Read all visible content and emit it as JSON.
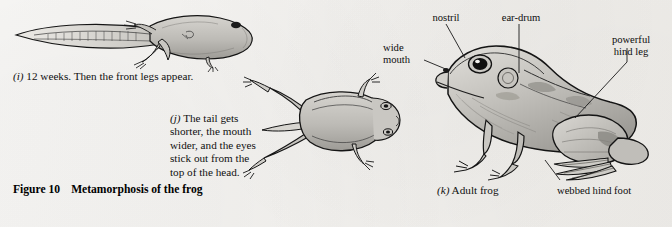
{
  "figure": {
    "number_label": "Figure 10",
    "title": "Metamorphosis of the frog"
  },
  "stages": [
    {
      "key": "i",
      "enumerator": "(i)",
      "caption": "12 weeks. Then the front legs appear.",
      "subject": "tadpole-with-legs"
    },
    {
      "key": "j",
      "enumerator": "(j)",
      "caption": "The tail gets\nshorter, the mouth\nwider, and the eyes\nstick out from the\ntop of the head.",
      "subject": "froglet"
    },
    {
      "key": "k",
      "enumerator": "(k)",
      "caption": "Adult frog",
      "subject": "adult-frog"
    }
  ],
  "anatomy_labels": [
    {
      "id": "nostril",
      "text": "nostril"
    },
    {
      "id": "ear-drum",
      "text": "ear-drum"
    },
    {
      "id": "wide-mouth",
      "text": "wide\nmouth"
    },
    {
      "id": "hind-leg",
      "text": "powerful\nhind leg"
    },
    {
      "id": "webbed-foot",
      "text": "webbed hind foot"
    }
  ],
  "colors": {
    "page": "#f4f2ee",
    "ink": "#101010",
    "body_fill": "#b9b7b2",
    "body_light": "#d3d1cc",
    "body_shadow": "#8f8d89"
  }
}
